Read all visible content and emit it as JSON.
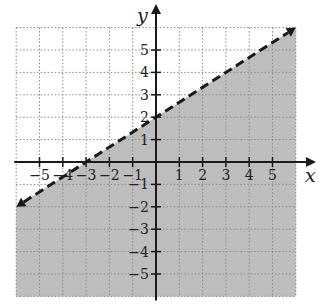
{
  "chart_data": {
    "type": "line",
    "title": "",
    "xlabel": "x",
    "ylabel": "y",
    "xlim": [
      -6,
      6
    ],
    "ylim": [
      -6,
      6
    ],
    "grid": true,
    "x_ticks": [
      -5,
      -4,
      -3,
      -2,
      -1,
      1,
      2,
      3,
      4,
      5
    ],
    "y_ticks": [
      -5,
      -4,
      -3,
      -2,
      -1,
      1,
      2,
      3,
      4,
      5
    ],
    "x_tick_labels": [
      "−5",
      "−4",
      "−3",
      "−2",
      "−1",
      "1",
      "2",
      "3",
      "4",
      "5"
    ],
    "y_tick_labels": [
      "−5",
      "−4",
      "−3",
      "−2",
      "−1",
      "1",
      "2",
      "3",
      "4",
      "5"
    ],
    "series": [
      {
        "name": "boundary line y = (2/3)x + 2",
        "style": "dashed",
        "slope": 0.6667,
        "intercept": 2,
        "x": [
          -6,
          -3,
          0,
          3,
          6
        ],
        "y": [
          -2,
          0,
          2,
          4,
          6
        ]
      }
    ],
    "shaded_region": {
      "inequality": "y < (2/3)x + 2",
      "side": "below",
      "color": "#bdbdbd"
    }
  },
  "colors": {
    "shade": "#bdbdbd",
    "grid": "#8a8a8a",
    "axis": "#1a1a1a",
    "line": "#1a1a1a",
    "background": "#ffffff"
  }
}
